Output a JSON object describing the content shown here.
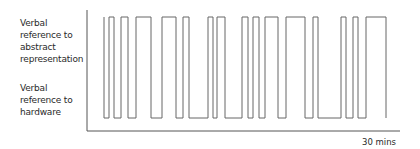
{
  "chart_data": {
    "type": "line",
    "subtype": "binary-step",
    "title": "",
    "xlabel": "30 mins",
    "ylabel": "",
    "y_levels": [
      {
        "name": "Verbal reference to abstract representation",
        "value": 1
      },
      {
        "name": "Verbal reference to hardware",
        "value": 0
      }
    ],
    "x_range_minutes": [
      0,
      30
    ],
    "grid": false,
    "legend": null,
    "high_segments_px": [
      [
        109,
        114
      ],
      [
        121,
        128
      ],
      [
        136,
        151
      ],
      [
        162,
        176
      ],
      [
        183,
        189
      ],
      [
        208,
        213
      ],
      [
        217,
        225
      ],
      [
        242,
        248
      ],
      [
        253,
        259
      ],
      [
        265,
        278
      ],
      [
        286,
        300
      ],
      [
        300,
        305
      ],
      [
        313,
        318
      ],
      [
        341,
        346
      ],
      [
        353,
        358
      ],
      [
        366,
        386
      ]
    ],
    "signal_start_px": 104,
    "signal_end_px": 386,
    "axis_px": {
      "x0": 87,
      "x1": 400,
      "y_top": 10,
      "y_axis": 131,
      "y_high": 17,
      "y_low": 118
    }
  },
  "labels": {
    "abstract": "Verbal reference to abstract representation",
    "hardware": "Verbal reference to hardware",
    "x_end": "30 mins"
  }
}
